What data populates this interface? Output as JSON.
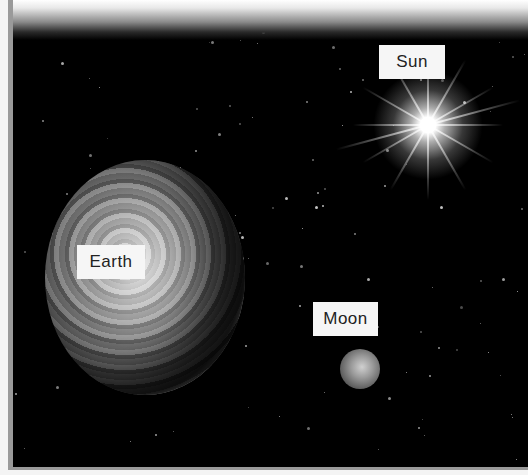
{
  "image": {
    "subject": "Sun, Earth and Moon in space",
    "style": "grayscale",
    "colors": {
      "space": "#000000",
      "frame": "#9a9a9a",
      "label_bg": "#f6f6f6",
      "label_text": "#222222"
    }
  },
  "labels": {
    "sun": "Sun",
    "earth": "Earth",
    "moon": "Moon"
  }
}
